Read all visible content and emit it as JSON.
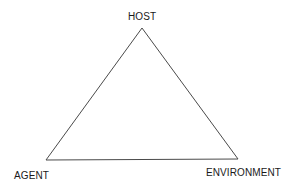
{
  "diagram": {
    "type": "epidemiologic-triangle",
    "nodes": [
      {
        "id": "host",
        "label": "HOST",
        "position": "top"
      },
      {
        "id": "agent",
        "label": "AGENT",
        "position": "bottom-left"
      },
      {
        "id": "environment",
        "label": "ENVIRONMENT",
        "position": "bottom-right"
      }
    ],
    "edges": [
      {
        "from": "host",
        "to": "agent"
      },
      {
        "from": "agent",
        "to": "environment"
      },
      {
        "from": "environment",
        "to": "host"
      }
    ],
    "colors": {
      "line": "#4a4a4a",
      "text": "#1a1a1a",
      "background": "#ffffff"
    }
  }
}
